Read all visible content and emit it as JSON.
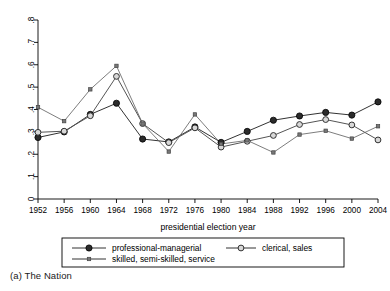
{
  "caption": "(a) The Nation",
  "chart_data": {
    "type": "line",
    "title": "",
    "subtitle": "",
    "xlabel": "presidential election year",
    "ylabel": "",
    "x": [
      1952,
      1956,
      1960,
      1964,
      1968,
      1972,
      1976,
      1980,
      1984,
      1988,
      1992,
      1996,
      2000,
      2004
    ],
    "categories": [
      "1952",
      "1956",
      "1960",
      "1964",
      "1968",
      "1972",
      "1976",
      "1980",
      "1984",
      "1988",
      "1992",
      "1996",
      "2000",
      "2004"
    ],
    "xlim": [
      1952,
      2004
    ],
    "ylim": [
      0,
      0.8
    ],
    "yticks": [
      0,
      0.1,
      0.2,
      0.3,
      0.4,
      0.5,
      0.6,
      0.7,
      0.8
    ],
    "ytick_labels": [
      "0",
      ".1",
      ".2",
      ".3",
      ".4",
      ".5",
      ".6",
      ".7",
      ".8"
    ],
    "grid": false,
    "legend_position": "bottom",
    "series": [
      {
        "name": "professional-managerial",
        "marker": "filled-circle",
        "color": "#333333",
        "values": [
          0.275,
          0.3,
          0.378,
          0.428,
          0.268,
          0.255,
          0.322,
          0.253,
          0.302,
          0.352,
          0.371,
          0.387,
          0.375,
          0.434
        ]
      },
      {
        "name": "clerical, sales",
        "marker": "open-circle",
        "color": "#555555",
        "values": [
          0.298,
          0.303,
          0.372,
          0.548,
          0.337,
          0.252,
          0.318,
          0.232,
          0.258,
          0.284,
          0.333,
          0.355,
          0.331,
          0.264
        ]
      },
      {
        "name": "skilled, semi-skilled, service",
        "marker": "small-square",
        "color": "#666666",
        "values": [
          0.41,
          0.348,
          0.49,
          0.595,
          0.337,
          0.212,
          0.378,
          0.246,
          0.262,
          0.208,
          0.288,
          0.305,
          0.27,
          0.325
        ]
      }
    ],
    "legend": [
      {
        "label": "professional-managerial",
        "marker": "filled-circle"
      },
      {
        "label": "clerical, sales",
        "marker": "open-circle"
      },
      {
        "label": "skilled, semi-skilled, service",
        "marker": "small-square"
      }
    ]
  }
}
